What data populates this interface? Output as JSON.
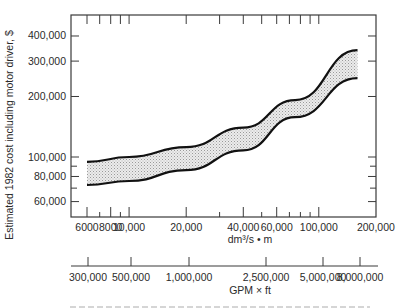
{
  "chart_data": {
    "type": "area",
    "title": "",
    "ylabel": "Estimated 1982 cost including motor driver, $",
    "xlabel": "dm³/s • m",
    "secondary_xlabel": "GPM × ft",
    "x_scale": "log",
    "y_scale": "log",
    "xlim": [
      6000,
      200000
    ],
    "ylim": [
      50000,
      500000
    ],
    "grid": false,
    "x_ticks": {
      "major": [
        {
          "value": 6000,
          "label": "6000"
        },
        {
          "value": 8000,
          "label": "8000"
        },
        {
          "value": 10000,
          "label": "10,000"
        },
        {
          "value": 20000,
          "label": "20,000"
        },
        {
          "value": 40000,
          "label": "40,000"
        },
        {
          "value": 60000,
          "label": "60,000"
        },
        {
          "value": 100000,
          "label": "100,000"
        },
        {
          "value": 200000,
          "label": "200,000"
        }
      ],
      "minor": [
        7000,
        9000,
        30000,
        50000,
        70000,
        80000,
        90000
      ]
    },
    "top_ticks": [
      6000,
      7000,
      8000,
      9000,
      10000,
      20000,
      30000,
      40000,
      50000,
      60000,
      70000,
      80000,
      90000,
      100000
    ],
    "y_ticks": {
      "major": [
        {
          "value": 60000,
          "label": "60,000"
        },
        {
          "value": 80000,
          "label": "80,000"
        },
        {
          "value": 100000,
          "label": "100,000"
        },
        {
          "value": 200000,
          "label": "200,000"
        },
        {
          "value": 300000,
          "label": "300,000"
        },
        {
          "value": 400000,
          "label": "400,000"
        }
      ],
      "minor": [
        70000,
        90000
      ]
    },
    "secondary_x_ticks": [
      {
        "label": "300,000",
        "px": 88
      },
      {
        "label": "500,000",
        "px": 131
      },
      {
        "label": "1,000,000",
        "px": 189
      },
      {
        "label": "2,500,000",
        "px": 266
      },
      {
        "label": "5,000,000",
        "px": 323
      },
      {
        "label": "8,000,000",
        "px": 360
      }
    ],
    "series": [
      {
        "name": "upper bound",
        "x": [
          6000,
          10000,
          20000,
          40000,
          75000,
          160000
        ],
        "values": [
          94500,
          100000,
          112000,
          140000,
          192000,
          340000
        ]
      },
      {
        "name": "lower bound",
        "x": [
          6000,
          10000,
          20000,
          40000,
          75000,
          160000
        ],
        "values": [
          72600,
          76000,
          86000,
          108000,
          158000,
          247000
        ]
      }
    ],
    "band_fill": "stippled gray between bounds"
  },
  "colors": {
    "axis": "#3a3a3a",
    "curve": "#111111",
    "band": "#d6d6d6",
    "text": "#2a2a2a"
  }
}
